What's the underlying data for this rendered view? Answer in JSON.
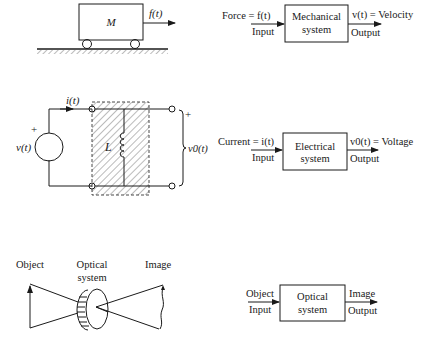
{
  "mechanical": {
    "figure": {
      "mass_label": "M",
      "force_label": "f(t)"
    },
    "block": {
      "input_top": "Force = f(t)",
      "input_bottom": "Input",
      "box_line1": "Mechanical",
      "box_line2": "system",
      "output_top": "v(t) = Velocity",
      "output_bottom": "Output"
    }
  },
  "electrical": {
    "figure": {
      "current_label": "i(t)",
      "source_label": "v(t)",
      "source_plus": "+",
      "inductor_label": "L",
      "output_plus": "+",
      "output_label": "v0(t)"
    },
    "block": {
      "input_top": "Current = i(t)",
      "input_bottom": "Input",
      "box_line1": "Electrical",
      "box_line2": "system",
      "output_top": "v0(t) = Voltage",
      "output_bottom": "Output"
    }
  },
  "optical": {
    "figure": {
      "object_label": "Object",
      "system_line1": "Optical",
      "system_line2": "system",
      "image_label": "Image"
    },
    "block": {
      "input_top": "Object",
      "input_bottom": "Input",
      "box_line1": "Optical",
      "box_line2": "system",
      "output_top": "Image",
      "output_bottom": "Output"
    }
  }
}
